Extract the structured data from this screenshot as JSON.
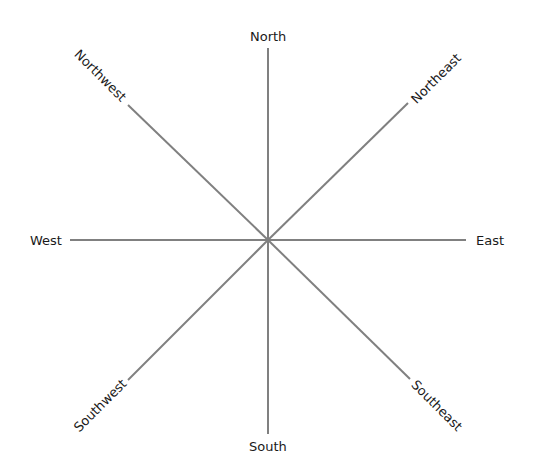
{
  "diagram": {
    "type": "compass-rose",
    "center": {
      "x": 268,
      "y": 240
    },
    "line_color": "#808080",
    "text_color": "#1a1a1a",
    "directions": [
      {
        "key": "north",
        "label": "North",
        "x1": 268,
        "y1": 240,
        "x2": 268,
        "y2": 48,
        "lx": 268,
        "ly": 36,
        "rot": 0
      },
      {
        "key": "northeast",
        "label": "Northeast",
        "x1": 268,
        "y1": 240,
        "x2": 408,
        "y2": 103,
        "lx": 436,
        "ly": 78,
        "rot": -45
      },
      {
        "key": "east",
        "label": "East",
        "x1": 268,
        "y1": 240,
        "x2": 466,
        "y2": 240,
        "lx": 490,
        "ly": 240,
        "rot": 0
      },
      {
        "key": "southeast",
        "label": "Southeast",
        "x1": 268,
        "y1": 240,
        "x2": 410,
        "y2": 379,
        "lx": 437,
        "ly": 405,
        "rot": 45
      },
      {
        "key": "south",
        "label": "South",
        "x1": 268,
        "y1": 240,
        "x2": 268,
        "y2": 434,
        "lx": 268,
        "ly": 446,
        "rot": 0
      },
      {
        "key": "southwest",
        "label": "Southwest",
        "x1": 268,
        "y1": 240,
        "x2": 128,
        "y2": 380,
        "lx": 100,
        "ly": 405,
        "rot": -45
      },
      {
        "key": "west",
        "label": "West",
        "x1": 268,
        "y1": 240,
        "x2": 70,
        "y2": 240,
        "lx": 46,
        "ly": 240,
        "rot": 0
      },
      {
        "key": "northwest",
        "label": "Northwest",
        "x1": 268,
        "y1": 240,
        "x2": 128,
        "y2": 105,
        "lx": 100,
        "ly": 75,
        "rot": 45
      }
    ]
  }
}
